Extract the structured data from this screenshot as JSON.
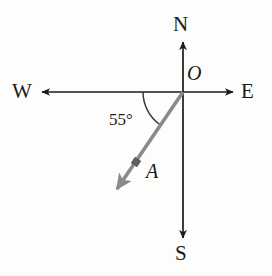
{
  "figure": {
    "background_color": "#fdfdfb",
    "axis_color": "#1a1a1a",
    "ray_color": "#8a8a8a",
    "arc_color": "#3a3a3a",
    "label_color": "#1a1a1a"
  },
  "labels": {
    "north": "N",
    "south": "S",
    "west": "W",
    "east": "E",
    "origin": "O",
    "point_a": "A",
    "angle": "55°"
  },
  "geometry": {
    "origin": {
      "x": 183,
      "y": 92
    },
    "north_tip": {
      "x": 183,
      "y": 42
    },
    "south_tip": {
      "x": 183,
      "y": 238
    },
    "west_tip": {
      "x": 42,
      "y": 92
    },
    "east_tip": {
      "x": 233,
      "y": 92
    },
    "ray_tip": {
      "x": 115,
      "y": 192
    },
    "ray_marker": {
      "x": 136,
      "y": 162
    },
    "angle_degrees": 55,
    "angle_arc_start": {
      "x": 143,
      "y": 92
    },
    "angle_arc_end": {
      "x": 157,
      "y": 126
    },
    "angle_arc_radius": 40
  }
}
